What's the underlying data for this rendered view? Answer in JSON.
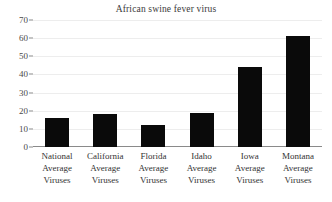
{
  "chart_data": {
    "type": "bar",
    "title": "African swine fever virus",
    "xlabel": "",
    "ylabel": "",
    "ylim": [
      0,
      70
    ],
    "yticks": [
      0,
      10,
      20,
      30,
      40,
      50,
      60,
      70
    ],
    "grid": true,
    "legend": false,
    "bar_color": "#0a0a0a",
    "categories": [
      "National Average Viruses",
      "California Average Viruses",
      "Florida Average Viruses",
      "Idaho Average Viruses",
      "Iowa Average Viruses",
      "Montana Average Viruses"
    ],
    "category_lines": [
      [
        "National",
        "Average",
        "Viruses"
      ],
      [
        "California",
        "Average",
        "Viruses"
      ],
      [
        "Florida",
        "Average",
        "Viruses"
      ],
      [
        "Idaho",
        "Average",
        "Viruses"
      ],
      [
        "Iowa",
        "Average",
        "Viruses"
      ],
      [
        "Montana",
        "Average",
        "Viruses"
      ]
    ],
    "values": [
      16,
      18,
      12,
      19,
      44,
      61
    ]
  }
}
